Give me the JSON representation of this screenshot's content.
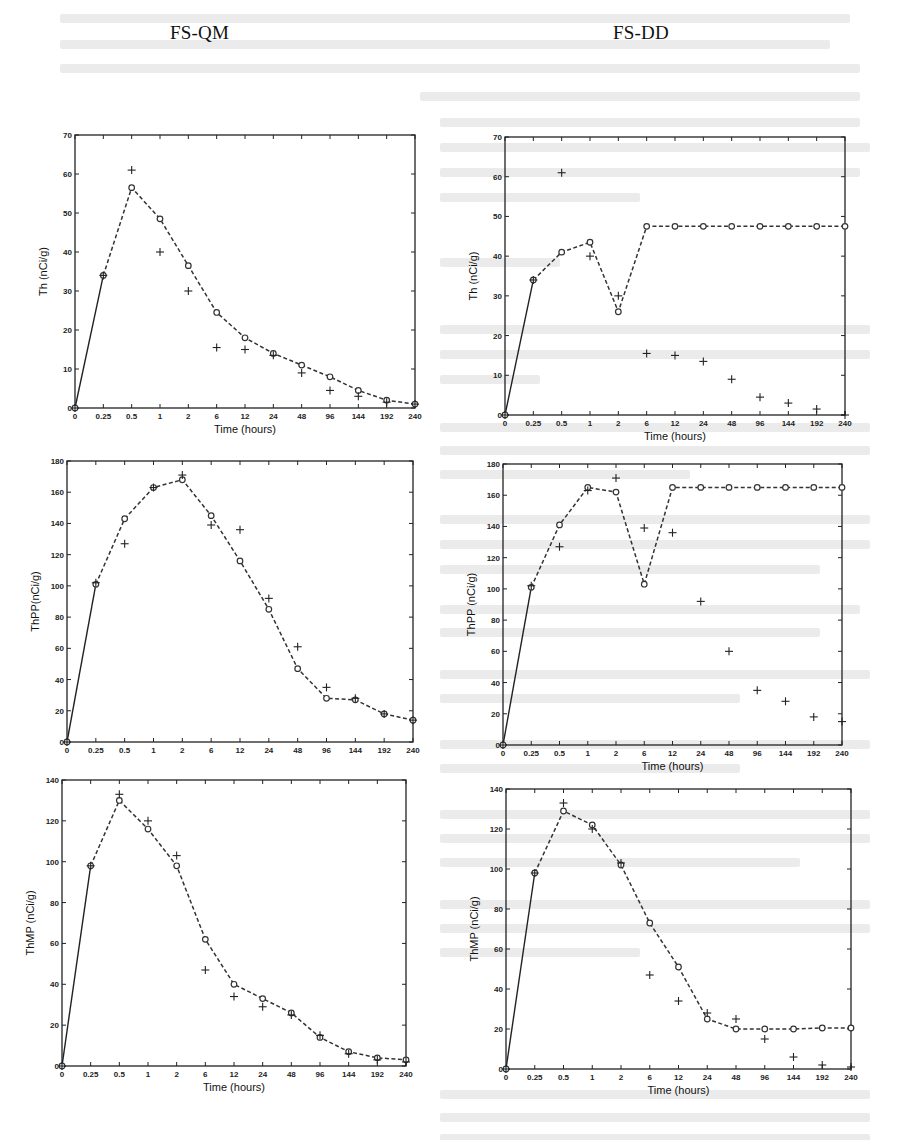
{
  "page": {
    "column_titles": [
      "FS-QM",
      "FS-DD"
    ]
  },
  "chart_data": [
    {
      "id": "th-fsqm",
      "type": "line",
      "column": "FS-QM",
      "title": "",
      "xlabel": "Time (hours)",
      "ylabel": "Th (nCi/g)",
      "categories": [
        "0",
        "0.25",
        "0.5",
        "1",
        "2",
        "6",
        "12",
        "24",
        "48",
        "96",
        "144",
        "192",
        "240"
      ],
      "ylim": [
        0,
        70
      ],
      "yticks": [
        0,
        10,
        20,
        30,
        40,
        50,
        60,
        70
      ],
      "grid": false,
      "legend": null,
      "series": [
        {
          "name": "model",
          "style": "dashed-circle",
          "values": [
            0,
            34,
            56.5,
            48.5,
            36.5,
            24.5,
            18,
            14,
            11,
            8,
            4.5,
            2,
            1
          ]
        },
        {
          "name": "observed",
          "style": "plus-marker",
          "values": [
            0,
            34,
            61,
            40,
            30,
            15.5,
            15,
            13.5,
            9,
            4.5,
            3,
            1.5,
            1
          ]
        }
      ]
    },
    {
      "id": "th-fsdd",
      "type": "line",
      "column": "FS-DD",
      "title": "",
      "xlabel": "Time (hours)",
      "ylabel": "Th (nCi/g)",
      "categories": [
        "0",
        "0.25",
        "0.5",
        "1",
        "2",
        "6",
        "12",
        "24",
        "48",
        "96",
        "144",
        "192",
        "240"
      ],
      "ylim": [
        0,
        70
      ],
      "yticks": [
        0,
        10,
        20,
        30,
        40,
        50,
        60,
        70
      ],
      "grid": false,
      "legend": null,
      "series": [
        {
          "name": "model",
          "style": "dashed-circle",
          "values": [
            0,
            34,
            41,
            43.5,
            26,
            47.5,
            47.5,
            47.5,
            47.5,
            47.5,
            47.5,
            47.5,
            47.5
          ]
        },
        {
          "name": "observed",
          "style": "plus-marker",
          "values": [
            0,
            34,
            61,
            40,
            30,
            15.5,
            15,
            13.5,
            9,
            4.5,
            3,
            1.5,
            0
          ]
        }
      ]
    },
    {
      "id": "thpp-fsqm",
      "type": "line",
      "column": "FS-QM",
      "title": "",
      "xlabel": "",
      "ylabel": "ThPP(nCi/g)",
      "categories": [
        "0",
        "0.25",
        "0.5",
        "1",
        "2",
        "6",
        "12",
        "24",
        "48",
        "96",
        "144",
        "192",
        "240"
      ],
      "ylim": [
        0,
        180
      ],
      "yticks": [
        0,
        20,
        40,
        60,
        80,
        100,
        120,
        140,
        160,
        180
      ],
      "grid": false,
      "legend": null,
      "series": [
        {
          "name": "model",
          "style": "dashed-circle",
          "values": [
            0,
            101,
            143,
            163,
            168,
            145,
            116,
            85,
            47,
            28,
            27,
            18,
            14
          ]
        },
        {
          "name": "observed",
          "style": "plus-marker",
          "values": [
            0,
            102,
            127,
            163,
            171,
            139,
            136,
            92,
            61,
            35,
            28,
            18,
            14
          ]
        }
      ]
    },
    {
      "id": "thpp-fsdd",
      "type": "line",
      "column": "FS-DD",
      "title": "",
      "xlabel": "Time (hours)",
      "ylabel": "ThPP (nCi/g)",
      "categories": [
        "0",
        "0.25",
        "0.5",
        "1",
        "2",
        "6",
        "12",
        "24",
        "48",
        "96",
        "144",
        "192",
        "240"
      ],
      "ylim": [
        0,
        180
      ],
      "yticks": [
        0,
        20,
        40,
        60,
        80,
        100,
        120,
        140,
        160,
        180
      ],
      "grid": false,
      "legend": null,
      "series": [
        {
          "name": "model",
          "style": "dashed-circle",
          "values": [
            0,
            101,
            141,
            165,
            162,
            103,
            165,
            165,
            165,
            165,
            165,
            165,
            165
          ]
        },
        {
          "name": "observed",
          "style": "plus-marker",
          "values": [
            0,
            102,
            127,
            163,
            171,
            139,
            136,
            92,
            60,
            35,
            28,
            18,
            15
          ]
        }
      ]
    },
    {
      "id": "thmp-fsqm",
      "type": "line",
      "column": "FS-QM",
      "title": "",
      "xlabel": "Time (hours)",
      "ylabel": "ThMP (nCi/g)",
      "categories": [
        "0",
        "0.25",
        "0.5",
        "1",
        "2",
        "6",
        "12",
        "24",
        "48",
        "96",
        "144",
        "192",
        "240"
      ],
      "ylim": [
        0,
        140
      ],
      "yticks": [
        0,
        20,
        40,
        60,
        80,
        100,
        120,
        140
      ],
      "grid": false,
      "legend": null,
      "series": [
        {
          "name": "model",
          "style": "dashed-circle",
          "values": [
            0,
            98,
            130,
            116,
            98,
            62,
            40,
            33,
            26,
            14,
            7,
            4,
            3
          ]
        },
        {
          "name": "observed",
          "style": "plus-marker",
          "values": [
            0,
            98,
            133,
            120,
            103,
            47,
            34,
            29,
            25,
            15,
            6,
            3,
            2
          ]
        }
      ]
    },
    {
      "id": "thmp-fsdd",
      "type": "line",
      "column": "FS-DD",
      "title": "",
      "xlabel": "Time (hours)",
      "ylabel": "ThMP (nCi/g)",
      "categories": [
        "0",
        "0.25",
        "0.5",
        "1",
        "2",
        "6",
        "12",
        "24",
        "48",
        "96",
        "144",
        "192",
        "240"
      ],
      "ylim": [
        0,
        140
      ],
      "yticks": [
        0,
        20,
        40,
        60,
        80,
        100,
        120,
        140
      ],
      "grid": false,
      "legend": null,
      "series": [
        {
          "name": "model",
          "style": "dashed-circle",
          "values": [
            0,
            98,
            129,
            122,
            102,
            73,
            51,
            25,
            20,
            20,
            20,
            20.5,
            20.5
          ]
        },
        {
          "name": "observed",
          "style": "plus-marker",
          "values": [
            0,
            98,
            133,
            120,
            103,
            47,
            34,
            28,
            25,
            15,
            6,
            2,
            1
          ]
        }
      ]
    }
  ]
}
